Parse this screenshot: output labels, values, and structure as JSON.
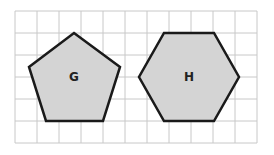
{
  "grid": {
    "x0": 15,
    "y0": 11,
    "cell": 22,
    "cols": 11,
    "rows": 6,
    "color": "#c8c8c8"
  },
  "shapes": [
    {
      "name": "G",
      "type": "pentagon",
      "label": "G",
      "fill": "#d4d4d4",
      "stroke": "#1a1a1a",
      "points": "74,33 120,67 103,121 46,121 29,67",
      "label_x": 74,
      "label_y": 81
    },
    {
      "name": "H",
      "type": "hexagon",
      "label": "H",
      "fill": "#d4d4d4",
      "stroke": "#1a1a1a",
      "points": "164,33 214,33 239,77 214,121 164,121 139,77",
      "label_x": 189,
      "label_y": 81
    }
  ]
}
